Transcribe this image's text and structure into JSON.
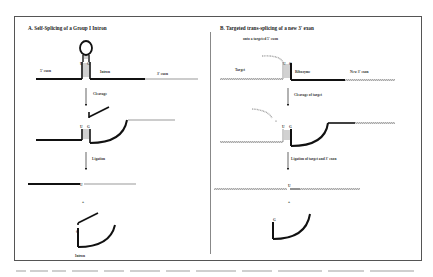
{
  "panel_a": {
    "title": "A. Self-Splicing of a Group I Intron",
    "labels": {
      "five_exon": "5' exon",
      "intron": "Intron",
      "three_exon": "3' exon",
      "cleavage": "Cleavage",
      "ligation": "Ligation",
      "plus": "+",
      "intron_bottom": "Intron",
      "u": "U",
      "g": "G",
      "u_bottom": "U",
      "g_bottom": "G"
    }
  },
  "panel_b": {
    "title": "B. Targeted trans-splicing of a new 3' exon",
    "subtitle": "onto a targeted 5' exon",
    "labels": {
      "target": "Target",
      "ribozyme": "Ribozyme",
      "new_exon": "New 3' exon",
      "cleavage": "Cleavage of target",
      "ligation": "Ligation of target and 3' exon",
      "plus": "+",
      "u": "U",
      "g": "G",
      "u_bottom": "U",
      "g_bottom": "G"
    }
  },
  "colors": {
    "exon_dark": "#111111",
    "exon_light": "#bbbbbb",
    "hatched": "#999999",
    "frame": "#555555"
  }
}
